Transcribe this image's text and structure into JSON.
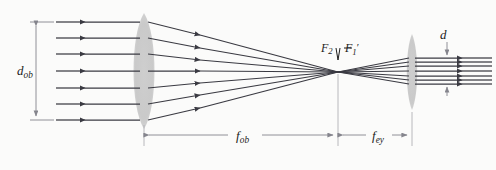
{
  "figure": {
    "background_color": "#fbfbfa",
    "ray_color": "#3a3a42",
    "lens_color": "#c9c9c9",
    "dimension_color": "#7d7d85",
    "labels": {
      "objective_diameter": {
        "base": "d",
        "sub": "ob",
        "prime": ""
      },
      "objective_focal_length": {
        "base": "f",
        "sub": "ob",
        "prime": ""
      },
      "eyepiece_focal_length": {
        "base": "f",
        "sub": "ey",
        "prime": ""
      },
      "exit_pupil_diameter": {
        "base": "d",
        "sub": "",
        "prime": ""
      },
      "focal_point_eyepiece": {
        "base": "F",
        "sub": "2",
        "prime": ""
      },
      "focal_point_objective": {
        "base": "F",
        "sub": "1",
        "prime": "′"
      }
    }
  },
  "optics": {
    "objective_lens": {
      "center_x": 144,
      "center_y": 71,
      "semi_height": 58,
      "semi_width": 14
    },
    "eyepiece_lens": {
      "center_x": 412,
      "center_y": 72,
      "semi_height": 38,
      "semi_width": 7
    },
    "focal_point": {
      "x": 338,
      "y": 72
    },
    "incoming_rays": {
      "count": 7,
      "y_values": [
        22,
        38,
        54,
        71,
        88,
        104,
        120
      ],
      "start_x": 56,
      "arrow_x": 85
    },
    "exit_rays": {
      "count": 7,
      "y_values": [
        58,
        62,
        66,
        71,
        76,
        80,
        84
      ],
      "end_x": 492,
      "arrow_x": 462
    },
    "dimensions": {
      "d_ob": {
        "x": 36,
        "y_top": 22,
        "y_bottom": 120
      },
      "f_ob": {
        "y": 135,
        "x_left": 144,
        "x_right": 338
      },
      "f_ey": {
        "y": 135,
        "x_left": 338,
        "x_right": 412
      },
      "d_exit": {
        "x": 447,
        "y_top": 38,
        "y_bottom": 100
      }
    }
  }
}
